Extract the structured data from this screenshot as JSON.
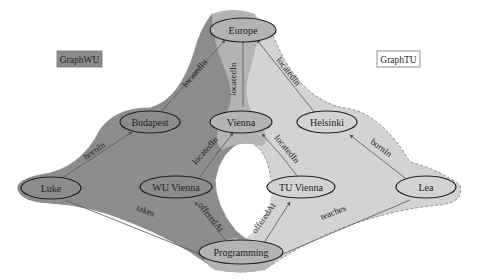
{
  "colors": {
    "graph_wu_fill": "#8a8a8a",
    "graph_tu_fill": "#d0d0d0",
    "overlap_fill": "#b2b2b2",
    "node_fill_wu": "#8a8a8a",
    "node_fill_tu": "#d4d4d4",
    "node_fill_shared": "#b2b2b2",
    "node_stroke": "#222222",
    "edge_stroke": "#555555",
    "hull_border": "#8f8f8f"
  },
  "legend": {
    "graph_wu": "GraphWU",
    "graph_tu": "GraphTU"
  },
  "nodes": {
    "europe": "Europe",
    "budapest": "Budapest",
    "vienna": "Vienna",
    "helsinki": "Helsinki",
    "luke": "Luke",
    "wu_vienna": "WU Vienna",
    "tu_vienna": "TU Vienna",
    "lea": "Lea",
    "programming": "Programming"
  },
  "edges": {
    "budapest_europe": "locatedIn",
    "vienna_europe": "locatedIn",
    "helsinki_europe": "locatedIn",
    "luke_budapest": "bornIn",
    "lea_helsinki": "bornIn",
    "wu_vienna_vienna": "locatedIn",
    "tu_vienna_vienna": "locatedIn",
    "luke_programming": "takes",
    "lea_programming": "teaches",
    "programming_wu_vienna": "offeredAt",
    "programming_tu_vienna": "offeredAt"
  }
}
